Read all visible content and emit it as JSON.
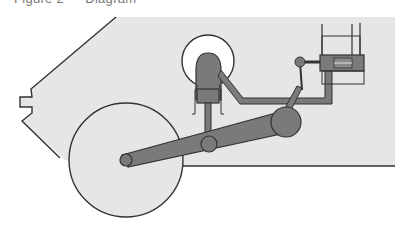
{
  "caption": {
    "text": "Figure 2 — Diagram"
  },
  "diagram": {
    "colors": {
      "body_fill": "#e6e6e6",
      "part_fill": "#7a7a7a",
      "outline": "#333333",
      "reservoir_fill": "#ffffff",
      "background": "#ffffff"
    },
    "components": [
      "body-panel",
      "wheel",
      "suspension-arm",
      "arm-pivot-joint",
      "arm-hub-joint",
      "arm-end-joint",
      "fluid-reservoir",
      "master-cylinder",
      "piston-rod",
      "connecting-rod",
      "hydraulic-line",
      "valve-block",
      "valve-pivot-joint"
    ]
  }
}
